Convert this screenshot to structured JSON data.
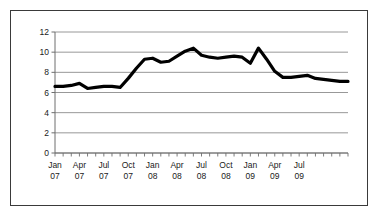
{
  "chart_data": {
    "type": "line",
    "title": "",
    "subtitle": "",
    "xlabel": "",
    "ylabel": "",
    "ylim": [
      0,
      12
    ],
    "yticks": [
      0,
      2,
      4,
      6,
      8,
      10,
      12
    ],
    "ytick_labels": [
      "0",
      "2",
      "4",
      "6",
      "8",
      "10",
      "12"
    ],
    "grid": true,
    "grid_color": "#8c8c8c",
    "legend": false,
    "legend_position": "none",
    "line_color": "#000000",
    "line_width": 3.2,
    "axis_color": "#6e6e6e",
    "x_major_labels": [
      "Jan\n07",
      "Apr\n07",
      "Jul\n07",
      "Oct\n07",
      "Jan\n08",
      "Apr\n08",
      "Jul\n08",
      "Oct\n08",
      "Jan\n09",
      "Apr\n09",
      "Jul\n09"
    ],
    "x_major_label_lines": [
      [
        "Jan",
        "07"
      ],
      [
        "Apr",
        "07"
      ],
      [
        "Jul",
        "07"
      ],
      [
        "Oct",
        "07"
      ],
      [
        "Jan",
        "08"
      ],
      [
        "Apr",
        "08"
      ],
      [
        "Jul",
        "08"
      ],
      [
        "Oct",
        "08"
      ],
      [
        "Jan",
        "09"
      ],
      [
        "Apr",
        "09"
      ],
      [
        "Jul",
        "09"
      ]
    ],
    "x": [
      "Jan 07",
      "Feb 07",
      "Mar 07",
      "Apr 07",
      "May 07",
      "Jun 07",
      "Jul 07",
      "Aug 07",
      "Sep 07",
      "Oct 07",
      "Nov 07",
      "Dec 07",
      "Jan 08",
      "Feb 08",
      "Mar 08",
      "Apr 08",
      "May 08",
      "Jun 08",
      "Jul 08",
      "Aug 08",
      "Sep 08",
      "Oct 08",
      "Nov 08",
      "Dec 08",
      "Jan 09",
      "Feb 09",
      "Mar 09",
      "Apr 09",
      "May 09",
      "Jun 09",
      "Jul 09"
    ],
    "values": [
      6.6,
      6.6,
      6.7,
      6.9,
      6.4,
      6.5,
      6.6,
      6.6,
      6.5,
      7.4,
      8.4,
      9.3,
      9.4,
      9.0,
      9.1,
      9.6,
      10.1,
      10.4,
      9.7,
      9.5,
      9.4,
      9.5,
      9.6,
      9.5,
      8.9,
      10.4,
      9.3,
      8.1,
      7.5,
      7.5,
      7.6
    ],
    "series": [
      {
        "name": "series-1",
        "values": [
          6.6,
          6.6,
          6.7,
          6.9,
          6.4,
          6.5,
          6.6,
          6.6,
          6.5,
          7.4,
          8.4,
          9.3,
          9.4,
          9.0,
          9.1,
          9.6,
          10.1,
          10.4,
          9.7,
          9.5,
          9.4,
          9.5,
          9.6,
          9.5,
          8.9,
          10.4,
          9.3,
          8.1,
          7.5,
          7.5,
          7.6
        ]
      }
    ],
    "tail_values": [
      7.7,
      7.4,
      7.3,
      7.2,
      7.1,
      7.1
    ],
    "full_values": [
      6.6,
      6.6,
      6.7,
      6.9,
      6.4,
      6.5,
      6.6,
      6.6,
      6.5,
      7.4,
      8.4,
      9.3,
      9.4,
      9.0,
      9.1,
      9.6,
      10.1,
      10.4,
      9.7,
      9.5,
      9.4,
      9.5,
      9.6,
      9.5,
      8.9,
      10.4,
      9.3,
      8.1,
      7.5,
      7.5,
      7.6,
      7.7,
      7.4,
      7.3,
      7.2,
      7.1,
      7.1
    ],
    "n_points": 37,
    "x_start_label": "Jan 07",
    "x_end_label": "Jul 09"
  },
  "figure": {
    "background_color": "#ffffff",
    "border_color": "#3a3a3a"
  }
}
